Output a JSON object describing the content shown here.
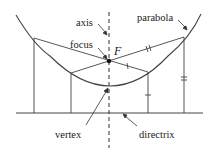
{
  "diagram": {
    "type": "parabola-focus-directrix",
    "labels": {
      "axis": "axis",
      "focus": "focus",
      "focus_symbol": "F",
      "parabola": "parabola",
      "vertex": "vertex",
      "directrix": "directrix"
    },
    "colors": {
      "stroke": "#333333",
      "background": "#ffffff"
    },
    "tick_marks": {
      "short_segment_ticks": 1,
      "long_segment_ticks": 2
    }
  }
}
